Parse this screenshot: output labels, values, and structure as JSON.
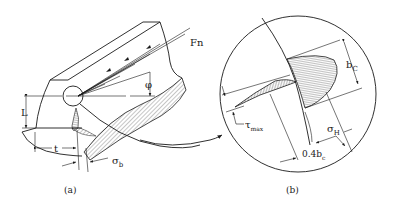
{
  "figure": {
    "panel_a": {
      "caption": "(a)",
      "labels": {
        "force": "Fn",
        "angle": "φ",
        "height": "L",
        "thickness": "t",
        "bending_stress": "σ",
        "bending_stress_sub": "b"
      }
    },
    "panel_b": {
      "caption": "(b)",
      "labels": {
        "contact_width": "b",
        "contact_width_sub": "C",
        "shear_stress": "τ",
        "shear_stress_sub": "max",
        "hertz_stress": "σ",
        "hertz_stress_sub": "H",
        "depth": "0.4b",
        "depth_sub": "c"
      }
    },
    "colors": {
      "ink": "#1a1a1a",
      "background": "#ffffff"
    }
  }
}
